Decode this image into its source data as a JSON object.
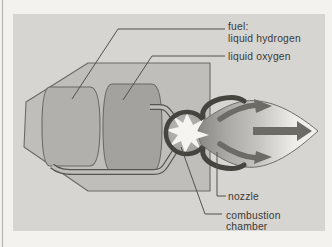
{
  "figure": {
    "type": "diagram",
    "labels": {
      "fuel_line1": "fuel:",
      "fuel_line2": "liquid hydrogen",
      "liquid_oxygen": "liquid oxygen",
      "nozzle": "nozzle",
      "combustion_line1": "combustion",
      "combustion_line2": "chamber"
    },
    "colors": {
      "page_background": "#f3f2ef",
      "panel_background": "#d6d5d1",
      "rocket_body": "#bfbeba",
      "fuel_tank": "#b1b0ac",
      "oxygen_tank": "#a3a29e",
      "chamber_dark_ring": "#45443e",
      "starburst_white": "#f5f4f1",
      "flame_dark": "#8b8a86",
      "flame_mid": "#c6c5c1",
      "flame_light": "#eeede9",
      "arrow_gray": "#6c6b65",
      "text_color": "#3b3936",
      "page_edge_line": "#b5b4b0"
    }
  }
}
